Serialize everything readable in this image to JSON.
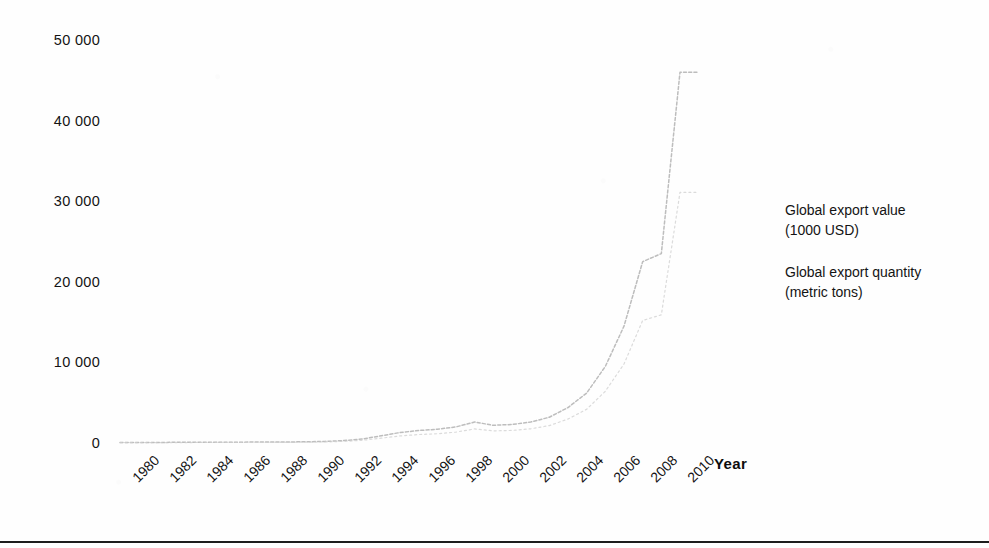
{
  "chart_data": {
    "type": "line",
    "title": "",
    "xlabel": "Year",
    "ylabel": "",
    "xlim": [
      1980,
      2011
    ],
    "ylim": [
      0,
      50000
    ],
    "grid": false,
    "legend_position": "right",
    "x_tick_labels": [
      "1980",
      "1982",
      "1984",
      "1986",
      "1988",
      "1990",
      "1992",
      "1994",
      "1996",
      "1998",
      "2000",
      "2002",
      "2004",
      "2006",
      "2008",
      "2010"
    ],
    "y_tick_labels": [
      "0",
      "10 000",
      "20 000",
      "30 000",
      "40 000",
      "50 000"
    ],
    "y_tick_values": [
      0,
      10000,
      20000,
      30000,
      40000,
      50000
    ],
    "x": [
      1980,
      1981,
      1982,
      1983,
      1984,
      1985,
      1986,
      1987,
      1988,
      1989,
      1990,
      1991,
      1992,
      1993,
      1994,
      1995,
      1996,
      1997,
      1998,
      1999,
      2000,
      2001,
      2002,
      2003,
      2004,
      2005,
      2006,
      2007,
      2008,
      2009,
      2010,
      2011
    ],
    "series": [
      {
        "name": "Global export value (1000 USD)",
        "legend_line1": "Global export value",
        "legend_line2": "(1000 USD)",
        "color": "#b9b9b9",
        "values": [
          60,
          70,
          75,
          80,
          90,
          95,
          100,
          110,
          120,
          130,
          150,
          200,
          300,
          500,
          900,
          1300,
          1550,
          1700,
          2000,
          2600,
          2200,
          2300,
          2600,
          3200,
          4400,
          6200,
          9500,
          14500,
          22500,
          23500,
          46000,
          46000
        ]
      },
      {
        "name": "Global export quantity (metric tons)",
        "legend_line1": "Global export quantity",
        "legend_line2": "(metric tons)",
        "color": "#cfcfcf",
        "values": [
          40,
          45,
          50,
          55,
          60,
          65,
          70,
          75,
          80,
          90,
          100,
          130,
          200,
          340,
          600,
          880,
          1050,
          1150,
          1350,
          1750,
          1500,
          1560,
          1760,
          2160,
          2970,
          4190,
          6420,
          9800,
          15200,
          15900,
          31100,
          31100
        ]
      }
    ]
  },
  "axis": {
    "x_title": "Year"
  }
}
